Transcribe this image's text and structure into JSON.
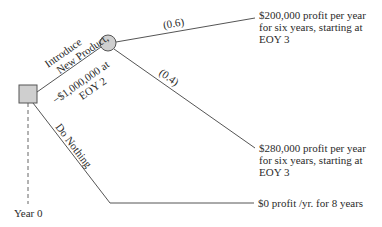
{
  "diagram": {
    "type": "decision-tree",
    "decision_node": {
      "shape": "square",
      "fill": "#cfcfcf",
      "stroke": "#555555"
    },
    "chance_node": {
      "shape": "circle",
      "fill": "#cfcfcf",
      "stroke": "#555555"
    },
    "line_color": "#555555",
    "branches": {
      "introduce": {
        "label_line1": "Introduce",
        "label_line2": "New Product,",
        "cost_line1": "−$1,000,000 at",
        "cost_line2": "EOY 2"
      },
      "do_nothing": {
        "label": "Do Nothing"
      }
    },
    "chance_branches": [
      {
        "probability": "(0.6)"
      },
      {
        "probability": "(0.4)"
      }
    ],
    "outcomes": [
      {
        "line1": "$200,000 profit per year",
        "line2": "for six years, starting at",
        "line3": "EOY 3"
      },
      {
        "line1": "$280,000 profit per year",
        "line2": "for six years, starting at",
        "line3": "EOY 3"
      },
      {
        "line1": "$0 profit /yr. for 8 years"
      }
    ],
    "timeline": {
      "label": "Year 0"
    }
  }
}
